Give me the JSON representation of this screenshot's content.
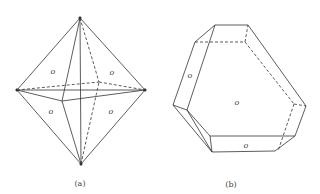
{
  "figure_a": {
    "caption": "(a)",
    "shape": "octahedron",
    "face_labels": [
      "o",
      "o",
      "o",
      "o"
    ]
  },
  "figure_b": {
    "caption": "(b)",
    "shape": "truncated-trigonal-prism",
    "face_labels": [
      "o",
      "o",
      "o"
    ]
  },
  "colors": {
    "line": "#333333",
    "background": "#ffffff"
  }
}
